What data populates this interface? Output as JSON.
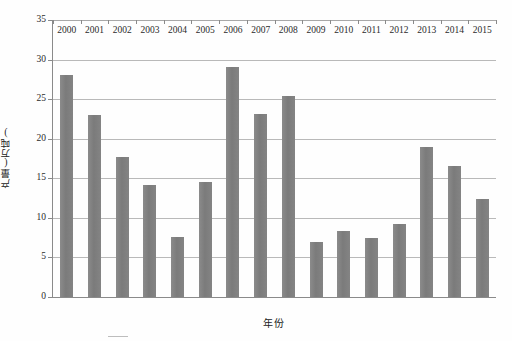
{
  "chart_data": {
    "type": "bar",
    "title": "",
    "subtitle": "",
    "xlabel": "年份",
    "ylabel": "产量(万吨)",
    "categories": [
      "2000",
      "2001",
      "2002",
      "2003",
      "2004",
      "2005",
      "2006",
      "2007",
      "2008",
      "2009",
      "2010",
      "2011",
      "2012",
      "2013",
      "2014",
      "2015"
    ],
    "values": [
      28.0,
      23.0,
      17.7,
      14.2,
      7.6,
      14.5,
      29.1,
      23.1,
      25.4,
      7.0,
      8.4,
      7.4,
      9.2,
      19.0,
      16.6,
      12.4
    ],
    "ylim": [
      0,
      35
    ],
    "ytick_values": [
      0,
      5,
      10,
      15,
      20,
      25,
      30,
      35
    ],
    "ytick_labels": [
      "0",
      "5",
      "10",
      "15",
      "20",
      "25",
      "30",
      "35"
    ],
    "grid": "horizontal",
    "legend": "none",
    "bar_color": "#808080",
    "gridline_color": "#b9b9b9",
    "axis_color": "#8a8a8a"
  },
  "axes": {
    "y_title": "产量(万吨)",
    "x_title": "年份"
  },
  "caption": {
    "sliver_text": ""
  }
}
